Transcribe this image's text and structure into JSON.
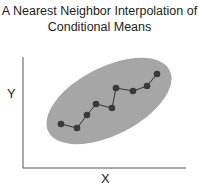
{
  "title": {
    "line1": "A Nearest Neighbor Interpolation of",
    "line2": "Conditional Means"
  },
  "axes": {
    "xlabel": "X",
    "ylabel": "Y"
  },
  "colors": {
    "ellipse_fill": "#a6a6a6",
    "point_fill": "#3a3a3a",
    "line": "#333333",
    "axis": "#555555"
  },
  "chart_data": {
    "type": "line",
    "title": "A Nearest Neighbor Interpolation of Conditional Means",
    "xlabel": "X",
    "ylabel": "Y",
    "grid": false,
    "points_px": [
      [
        61,
        124
      ],
      [
        77,
        128
      ],
      [
        87,
        115
      ],
      [
        96,
        104
      ],
      [
        112,
        108
      ],
      [
        116,
        88
      ],
      [
        133,
        91
      ],
      [
        147,
        86
      ],
      [
        157,
        74
      ]
    ],
    "annotations": [
      "shaded ellipse representing data cloud"
    ]
  }
}
